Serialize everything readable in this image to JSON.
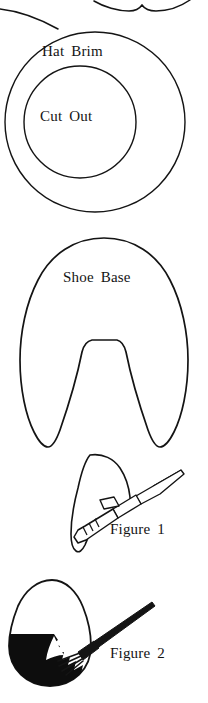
{
  "document": {
    "kind": "craft-pattern-sheet",
    "background_color": "#ffffff",
    "ink_color": "#141414",
    "width": 208,
    "height": 703
  },
  "shapes": {
    "top_partial": {
      "name": "partial-pattern-piece-cropped",
      "description": "bottom edge of an unlabeled pattern piece cropped by the top of the page"
    },
    "hat_brim": {
      "label": "Hat Brim",
      "outer_circle": {
        "cx": 95,
        "cy": 122,
        "r": 90
      },
      "inner_circle": {
        "cx": 80,
        "cy": 122,
        "r": 56
      }
    },
    "cut_out": {
      "label": "Cut Out"
    },
    "shoe_base": {
      "label": "Shoe Base"
    },
    "figure_1": {
      "label": "Figure 1",
      "description": "craft knife slicing a slot in the shoe piece"
    },
    "figure_2": {
      "label": "Figure 2",
      "description": "egg with lower half painted black and a paintbrush"
    }
  }
}
